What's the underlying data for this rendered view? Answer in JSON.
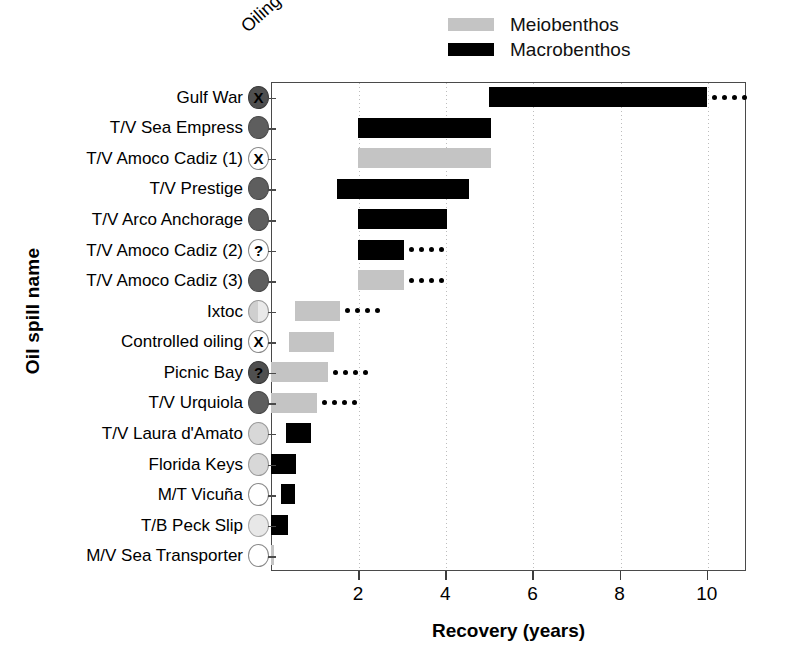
{
  "chart_data": {
    "type": "bar",
    "title": "",
    "xlabel": "Recovery (years)",
    "ylabel": "Oil spill name",
    "xlim": [
      0,
      10.9
    ],
    "xticks": [
      2,
      4,
      6,
      8,
      10
    ],
    "grid": true,
    "legend_position": "top-right",
    "orientation": "horizontal-floating-range",
    "legend": [
      {
        "name": "Meiobenthos",
        "color": "#c4c4c4"
      },
      {
        "name": "Macrobenthos",
        "color": "#000000"
      }
    ],
    "oiling_header": "Oiling",
    "categories": [
      "Gulf War",
      "T/V Sea Empress",
      "T/V Amoco Cadiz (1)",
      "T/V Prestige",
      "T/V Arco Anchorage",
      "T/V Amoco Cadiz (2)",
      "T/V Amoco Cadiz (3)",
      "Ixtoc",
      "Controlled oiling",
      "Picnic Bay",
      "T/V Urquiola",
      "T/V Laura d'Amato",
      "Florida Keys",
      "M/T Vicuña",
      "T/B Peck Slip",
      "M/V Sea Transporter"
    ],
    "rows": [
      {
        "label": "Gulf War",
        "series": "Macrobenthos",
        "start": 5.0,
        "end": 10.0,
        "ongoing": true,
        "oiling": "heavy-unknown",
        "oiling_glyph": "X",
        "oiling_fill": "f-darker",
        "oiling_glyph_color": "g-black"
      },
      {
        "label": "T/V Sea Empress",
        "series": "Macrobenthos",
        "start": 2.0,
        "end": 5.05,
        "ongoing": false,
        "oiling": "heavy",
        "oiling_glyph": "",
        "oiling_fill": "f-dark",
        "oiling_glyph_color": "g-white"
      },
      {
        "label": "T/V Amoco Cadiz (1)",
        "series": "Meiobenthos",
        "start": 2.0,
        "end": 5.05,
        "ongoing": false,
        "oiling": "unknown",
        "oiling_glyph": "X",
        "oiling_fill": "f-white",
        "oiling_glyph_color": "g-black"
      },
      {
        "label": "T/V Prestige",
        "series": "Macrobenthos",
        "start": 1.52,
        "end": 4.55,
        "ongoing": false,
        "oiling": "heavy",
        "oiling_glyph": "",
        "oiling_fill": "f-dark",
        "oiling_glyph_color": "g-white"
      },
      {
        "label": "T/V Arco Anchorage",
        "series": "Macrobenthos",
        "start": 2.0,
        "end": 4.05,
        "ongoing": false,
        "oiling": "heavy",
        "oiling_glyph": "",
        "oiling_fill": "f-dark",
        "oiling_glyph_color": "g-white"
      },
      {
        "label": "T/V Amoco Cadiz (2)",
        "series": "Macrobenthos",
        "start": 2.0,
        "end": 3.05,
        "ongoing": true,
        "oiling": "uncertain",
        "oiling_glyph": "?",
        "oiling_fill": "f-white",
        "oiling_glyph_color": "g-black"
      },
      {
        "label": "T/V Amoco Cadiz (3)",
        "series": "Meiobenthos",
        "start": 2.0,
        "end": 3.05,
        "ongoing": true,
        "oiling": "heavy",
        "oiling_glyph": "",
        "oiling_fill": "f-dark",
        "oiling_glyph_color": "g-white"
      },
      {
        "label": "Ixtoc",
        "series": "Meiobenthos",
        "start": 0.55,
        "end": 1.58,
        "ongoing": true,
        "oiling": "light",
        "oiling_glyph": "",
        "oiling_fill": "f-half",
        "oiling_glyph_color": "g-black"
      },
      {
        "label": "Controlled oiling",
        "series": "Meiobenthos",
        "start": 0.42,
        "end": 1.45,
        "ongoing": false,
        "oiling": "unknown",
        "oiling_glyph": "X",
        "oiling_fill": "f-white",
        "oiling_glyph_color": "g-black"
      },
      {
        "label": "Picnic Bay",
        "series": "Meiobenthos",
        "start": 0.0,
        "end": 1.3,
        "ongoing": true,
        "oiling": "uncertain",
        "oiling_glyph": "?",
        "oiling_fill": "f-darker",
        "oiling_glyph_color": "g-black"
      },
      {
        "label": "T/V Urquiola",
        "series": "Meiobenthos",
        "start": 0.0,
        "end": 1.05,
        "ongoing": true,
        "oiling": "heavy",
        "oiling_glyph": "",
        "oiling_fill": "f-dark",
        "oiling_glyph_color": "g-white"
      },
      {
        "label": "T/V Laura d'Amato",
        "series": "Macrobenthos",
        "start": 0.35,
        "end": 0.92,
        "ongoing": false,
        "oiling": "light",
        "oiling_glyph": "",
        "oiling_fill": "f-light",
        "oiling_glyph_color": "g-black"
      },
      {
        "label": "Florida Keys",
        "series": "Macrobenthos",
        "start": 0.0,
        "end": 0.57,
        "ongoing": false,
        "oiling": "light",
        "oiling_glyph": "",
        "oiling_fill": "f-light",
        "oiling_glyph_color": "g-black"
      },
      {
        "label": "M/T Vicuña",
        "series": "Macrobenthos",
        "start": 0.22,
        "end": 0.55,
        "ongoing": false,
        "oiling": "none",
        "oiling_glyph": "",
        "oiling_fill": "f-white",
        "oiling_glyph_color": "g-black"
      },
      {
        "label": "T/B Peck Slip",
        "series": "Macrobenthos",
        "start": 0.0,
        "end": 0.38,
        "ongoing": false,
        "oiling": "light",
        "oiling_glyph": "",
        "oiling_fill": "f-lighter",
        "oiling_glyph_color": "g-black"
      },
      {
        "label": "M/V Sea Transporter",
        "series": "Meiobenthos",
        "start": 0.0,
        "end": 0.08,
        "ongoing": false,
        "oiling": "none",
        "oiling_glyph": "",
        "oiling_fill": "f-white",
        "oiling_glyph_color": "g-black"
      }
    ]
  }
}
